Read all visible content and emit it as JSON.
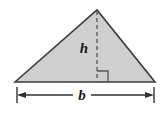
{
  "figure": {
    "name": "triangle-area-diagram",
    "background_color": "#ffffff",
    "labels": {
      "height_label": "h",
      "base_label": "b"
    },
    "shape": {
      "type": "triangle",
      "fill_color": "#cfcfcf",
      "stroke_color": "#3a3a3a",
      "stroke_width": 1.6,
      "vertices": [
        {
          "name": "bottom-left",
          "x": 15,
          "y": 82
        },
        {
          "name": "apex",
          "x": 97,
          "y": 10
        },
        {
          "name": "bottom-right",
          "x": 155,
          "y": 82
        }
      ]
    },
    "height_segment": {
      "name": "height-dashed-line",
      "style": "dashed",
      "stroke_color": "#555555",
      "stroke_width": 1.3,
      "dash_pattern": "4 3",
      "from_x": 97,
      "from_y": 10,
      "to_x": 97,
      "to_y": 82
    },
    "right_angle_marker": {
      "name": "right-angle-square",
      "stroke_color": "#555555",
      "stroke_width": 1.3,
      "x": 97,
      "y": 71,
      "size": 11
    },
    "base_dimension": {
      "name": "base-dimension-line",
      "stroke_color": "#333333",
      "stroke_width": 1.3,
      "line_y": 95,
      "left_x": 17,
      "right_x": 154,
      "gap_left_x": 73,
      "gap_right_x": 91,
      "extension_tick_top": 87,
      "extension_tick_bottom": 103,
      "arrowhead_length": 7,
      "arrowhead_half_width": 3
    },
    "label_positions": {
      "height_label_x": 84,
      "height_label_y": 53,
      "base_label_x": 82,
      "base_label_y": 100
    }
  }
}
